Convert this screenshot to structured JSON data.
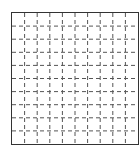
{
  "grid": {
    "columns": 10,
    "rows": 10,
    "border_color": "#333333",
    "line_color": "#555555",
    "line_style": "dashed"
  }
}
